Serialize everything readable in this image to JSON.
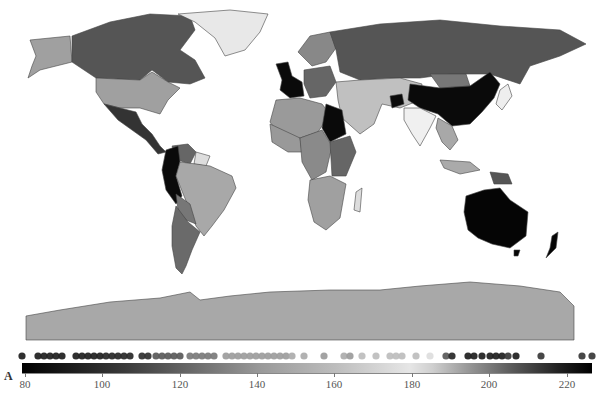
{
  "panel_label": "A",
  "colorbar": {
    "min": 80,
    "max": 227,
    "ticks": [
      {
        "label": "80",
        "x": 25
      },
      {
        "label": "100",
        "x": 102
      },
      {
        "label": "120",
        "x": 180
      },
      {
        "label": "140",
        "x": 257
      },
      {
        "label": "160",
        "x": 334
      },
      {
        "label": "180",
        "x": 412
      },
      {
        "label": "200",
        "x": 489
      },
      {
        "label": "220",
        "x": 567
      }
    ],
    "colormap": "diverging grayscale: black (low) -> light gray (~180) -> black (high)"
  },
  "dots": [
    {
      "x": 22,
      "shade": "#1a1a1a"
    },
    {
      "x": 38,
      "shade": "#1a1a1a"
    },
    {
      "x": 44,
      "shade": "#1a1a1a"
    },
    {
      "x": 50,
      "shade": "#1a1a1a"
    },
    {
      "x": 56,
      "shade": "#1a1a1a"
    },
    {
      "x": 62,
      "shade": "#1a1a1a"
    },
    {
      "x": 76,
      "shade": "#1a1a1a"
    },
    {
      "x": 82,
      "shade": "#1a1a1a"
    },
    {
      "x": 88,
      "shade": "#1a1a1a"
    },
    {
      "x": 94,
      "shade": "#1a1a1a"
    },
    {
      "x": 100,
      "shade": "#1a1a1a"
    },
    {
      "x": 106,
      "shade": "#222"
    },
    {
      "x": 112,
      "shade": "#222"
    },
    {
      "x": 118,
      "shade": "#222"
    },
    {
      "x": 124,
      "shade": "#222"
    },
    {
      "x": 130,
      "shade": "#222"
    },
    {
      "x": 142,
      "shade": "#2a2a2a"
    },
    {
      "x": 148,
      "shade": "#2a2a2a"
    },
    {
      "x": 156,
      "shade": "#555"
    },
    {
      "x": 162,
      "shade": "#555"
    },
    {
      "x": 168,
      "shade": "#555"
    },
    {
      "x": 174,
      "shade": "#555"
    },
    {
      "x": 180,
      "shade": "#555"
    },
    {
      "x": 190,
      "shade": "#777"
    },
    {
      "x": 196,
      "shade": "#777"
    },
    {
      "x": 202,
      "shade": "#777"
    },
    {
      "x": 208,
      "shade": "#777"
    },
    {
      "x": 214,
      "shade": "#777"
    },
    {
      "x": 226,
      "shade": "#9a9a9a"
    },
    {
      "x": 232,
      "shade": "#9a9a9a"
    },
    {
      "x": 238,
      "shade": "#9a9a9a"
    },
    {
      "x": 244,
      "shade": "#9a9a9a"
    },
    {
      "x": 250,
      "shade": "#9a9a9a"
    },
    {
      "x": 256,
      "shade": "#9a9a9a"
    },
    {
      "x": 262,
      "shade": "#9a9a9a"
    },
    {
      "x": 268,
      "shade": "#9a9a9a"
    },
    {
      "x": 274,
      "shade": "#9a9a9a"
    },
    {
      "x": 280,
      "shade": "#9a9a9a"
    },
    {
      "x": 286,
      "shade": "#9a9a9a"
    },
    {
      "x": 292,
      "shade": "#aaa"
    },
    {
      "x": 304,
      "shade": "#aaa"
    },
    {
      "x": 324,
      "shade": "#999"
    },
    {
      "x": 344,
      "shade": "#aaa"
    },
    {
      "x": 350,
      "shade": "#999"
    },
    {
      "x": 362,
      "shade": "#bbb"
    },
    {
      "x": 376,
      "shade": "#bbb"
    },
    {
      "x": 390,
      "shade": "#bbb"
    },
    {
      "x": 396,
      "shade": "#bbb"
    },
    {
      "x": 402,
      "shade": "#bbb"
    },
    {
      "x": 416,
      "shade": "#bbb"
    },
    {
      "x": 430,
      "shade": "#ddd"
    },
    {
      "x": 446,
      "shade": "#555"
    },
    {
      "x": 452,
      "shade": "#222"
    },
    {
      "x": 468,
      "shade": "#1a1a1a"
    },
    {
      "x": 474,
      "shade": "#1a1a1a"
    },
    {
      "x": 482,
      "shade": "#1a1a1a"
    },
    {
      "x": 490,
      "shade": "#1a1a1a"
    },
    {
      "x": 496,
      "shade": "#1a1a1a"
    },
    {
      "x": 502,
      "shade": "#1a1a1a"
    },
    {
      "x": 508,
      "shade": "#333"
    },
    {
      "x": 516,
      "shade": "#1a1a1a"
    },
    {
      "x": 541,
      "shade": "#333"
    },
    {
      "x": 582,
      "shade": "#333"
    },
    {
      "x": 592,
      "shade": "#333"
    }
  ],
  "regions": {
    "greenland": "#e8e8e8",
    "alaska": "#a0a0a0",
    "canada": "#555555",
    "usa": "#a0a0a0",
    "mexico_central_america": "#333333",
    "colombia_ecuador_peru": "#0a0a0a",
    "venezuela": "#666666",
    "guianas": "#dddddd",
    "brazil": "#a8a8a8",
    "bolivia_paraguay": "#777777",
    "argentina_chile": "#6a6a6a",
    "uk_france": "#0a0a0a",
    "scandinavia": "#888888",
    "russia": "#555555",
    "kazakhstan_middle_east": "#c0c0c0",
    "north_africa": "#9a9a9a",
    "egypt_sudan": "#0a0a0a",
    "west_africa": "#999999",
    "central_africa": "#8a8a8a",
    "east_africa": "#666666",
    "southern_africa": "#a0a0a0",
    "madagascar": "#dddddd",
    "india": "#f0f0f0",
    "china": "#0a0a0a",
    "mongolia": "#777777",
    "afghanistan": "#0a0a0a",
    "japan_korea": "#eeeeee",
    "southeast_asia": "#a8a8a8",
    "indonesia": "#aaaaaa",
    "papua": "#555555",
    "australia": "#050505",
    "new_zealand": "#050505",
    "antarctica": "#a8a8a8"
  }
}
